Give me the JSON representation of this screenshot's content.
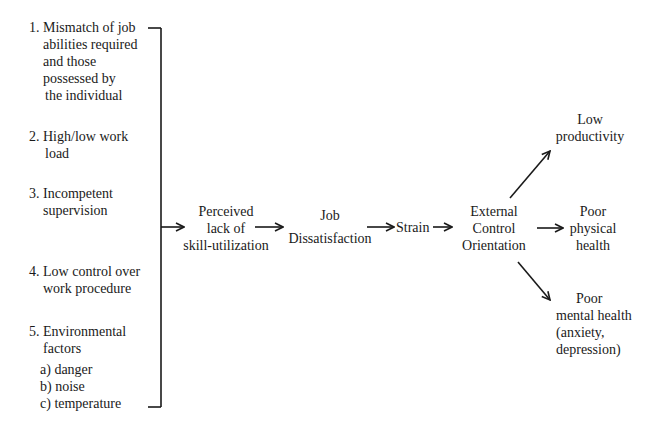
{
  "causes": [
    {
      "num": "1.",
      "lines": [
        "Mismatch of job",
        "abilities required",
        "and those",
        "possessed by",
        "the individual"
      ]
    },
    {
      "num": "2.",
      "lines": [
        "High/low work",
        "load"
      ]
    },
    {
      "num": "3.",
      "lines": [
        "Incompetent",
        "supervision"
      ]
    },
    {
      "num": "4.",
      "lines": [
        "Low control over",
        "work procedure"
      ]
    },
    {
      "num": "5.",
      "lines": [
        "Environmental",
        "factors"
      ],
      "subitems": [
        "a) danger",
        "b) noise",
        "c) temperature"
      ]
    }
  ],
  "chain": {
    "perceived": [
      "Perceived",
      "lack of",
      "skill-utilization"
    ],
    "job": [
      "Job",
      "Dissatisfaction"
    ],
    "strain": "Strain",
    "external": [
      "External",
      "Control",
      "Orientation"
    ]
  },
  "outcomes": {
    "low_productivity": [
      "Low",
      "productivity"
    ],
    "physical": [
      "Poor",
      "physical",
      "health"
    ],
    "mental": [
      "Poor",
      "mental health",
      "(anxiety,",
      "depression)"
    ]
  },
  "colors": {
    "line": "#1a1a1a",
    "background": "#ffffff"
  }
}
